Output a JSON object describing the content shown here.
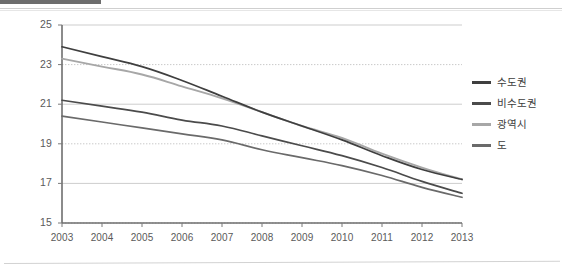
{
  "page": {
    "top_bar_color": "#6d6d6d",
    "background_color": "#ffffff"
  },
  "legend": {
    "position": "right",
    "items": [
      {
        "label": "수도권",
        "color": "#3f3f3f"
      },
      {
        "label": "비수도권",
        "color": "#4b4b4b"
      },
      {
        "label": "광역시",
        "color": "#a7a7a7"
      },
      {
        "label": "도",
        "color": "#6a6a6a"
      }
    ]
  },
  "axes": {
    "y_ticks": [
      "15",
      "17",
      "19",
      "21",
      "23",
      "25"
    ],
    "x_ticks": [
      "2003",
      "2004",
      "2005",
      "2006",
      "2007",
      "2008",
      "2009",
      "2010",
      "2011",
      "2012",
      "2013"
    ]
  },
  "chart_data": {
    "type": "line",
    "title": "",
    "subtitle": "",
    "xlabel": "",
    "ylabel": "",
    "x": [
      2003,
      2004,
      2005,
      2006,
      2007,
      2008,
      2009,
      2010,
      2011,
      2012,
      2013
    ],
    "categories": [
      "2003",
      "2004",
      "2005",
      "2006",
      "2007",
      "2008",
      "2009",
      "2010",
      "2011",
      "2012",
      "2013"
    ],
    "xlim": [
      2003,
      2013
    ],
    "ylim": [
      15,
      25
    ],
    "y_ticks": [
      15,
      17,
      19,
      21,
      23,
      25
    ],
    "x_ticks": [
      2003,
      2004,
      2005,
      2006,
      2007,
      2008,
      2009,
      2010,
      2011,
      2012,
      2013
    ],
    "grid": "horizontal",
    "legend_position": "right",
    "series": [
      {
        "name": "수도권",
        "color": "#3f3f3f",
        "values": [
          23.9,
          23.4,
          22.9,
          22.2,
          21.4,
          20.6,
          19.9,
          19.2,
          18.4,
          17.7,
          17.2
        ]
      },
      {
        "name": "비수도권",
        "color": "#4b4b4b",
        "values": [
          21.2,
          20.9,
          20.6,
          20.2,
          19.9,
          19.4,
          18.9,
          18.4,
          17.8,
          17.1,
          16.5
        ]
      },
      {
        "name": "광역시",
        "color": "#a7a7a7",
        "values": [
          23.3,
          22.9,
          22.5,
          21.9,
          21.3,
          20.6,
          19.9,
          19.3,
          18.5,
          17.8,
          17.2
        ]
      },
      {
        "name": "도",
        "color": "#6a6a6a",
        "values": [
          20.4,
          20.1,
          19.8,
          19.5,
          19.2,
          18.7,
          18.3,
          17.9,
          17.4,
          16.8,
          16.3
        ]
      }
    ]
  }
}
